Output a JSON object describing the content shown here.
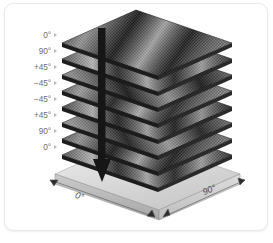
{
  "figure": {
    "caption": "",
    "background_color": "#ffffff",
    "card_border_color": "#e8e8e8"
  },
  "stack": {
    "description": "Exploded isometric view of an eight-ply symmetric composite laminate above a base plate",
    "ply_count": 8,
    "plies": [
      {
        "index": 1,
        "label": "0°",
        "angle_deg": 0,
        "position": "top"
      },
      {
        "index": 2,
        "label": "90°",
        "angle_deg": 90,
        "position": "2"
      },
      {
        "index": 3,
        "label": "+45°",
        "angle_deg": 45,
        "position": "3"
      },
      {
        "index": 4,
        "label": "−45°",
        "angle_deg": -45,
        "position": "4"
      },
      {
        "index": 5,
        "label": "−45°",
        "angle_deg": -45,
        "position": "5"
      },
      {
        "index": 6,
        "label": "+45°",
        "angle_deg": 45,
        "position": "6"
      },
      {
        "index": 7,
        "label": "90°",
        "angle_deg": 90,
        "position": "7"
      },
      {
        "index": 8,
        "label": "0°",
        "angle_deg": 0,
        "position": "bottom"
      }
    ],
    "sequence_text": "0° / 90° / +45° / −45° / −45° / +45° / 90° / 0°",
    "ply_color_dark": "#232323",
    "ply_color_mid": "#6b6b6b",
    "ply_color_light": "#cfcfcf"
  },
  "base_plate": {
    "name": "base-plate",
    "top_color": "#dcdcdc",
    "front_color": "#b4b4b4",
    "side_color": "#c8c8c8",
    "edge_color": "#8a8a8a"
  },
  "arrow": {
    "name": "stacking-direction-arrow",
    "direction": "down",
    "color": "#1b1b1b"
  },
  "dimensions": [
    {
      "name": "left-edge-dimension",
      "label": "0°",
      "edge": "left-front"
    },
    {
      "name": "right-edge-dimension",
      "label": "90°",
      "edge": "right-front"
    }
  ],
  "icons": {
    "ply-tick-icon": "right-pointing-triangle",
    "dimension-arrow-icon": "double-headed-arrow",
    "stack-arrow-icon": "down-arrow"
  }
}
